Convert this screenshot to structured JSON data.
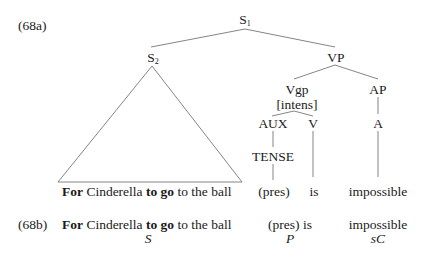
{
  "example_a": {
    "label": "(68a)",
    "nodes": {
      "s1": "S",
      "s1_sub": "1",
      "s2": "S",
      "s2_sub": "2",
      "vp": "VP",
      "vgp": "Vgp",
      "vgp_feature": "[intens]",
      "ap": "AP",
      "aux": "AUX",
      "v": "V",
      "a": "A",
      "tense": "TENSE"
    },
    "leaves": {
      "sentence": [
        {
          "text": "For",
          "bold": true
        },
        {
          "text": " Cinderella ",
          "bold": false
        },
        {
          "text": "to go",
          "bold": true
        },
        {
          "text": " to the ball",
          "bold": false
        }
      ],
      "pres": "(pres)",
      "is": "is",
      "impossible": "impossible"
    }
  },
  "example_b": {
    "label": "(68b)",
    "sentence": [
      {
        "text": "For",
        "bold": true
      },
      {
        "text": " Cinderella ",
        "bold": false
      },
      {
        "text": "to go",
        "bold": true
      },
      {
        "text": " to the ball",
        "bold": false
      }
    ],
    "predicate": "(pres) is",
    "complement": "impossible",
    "functions": {
      "subject": "S",
      "predicate": "P",
      "complement": "sC"
    }
  }
}
